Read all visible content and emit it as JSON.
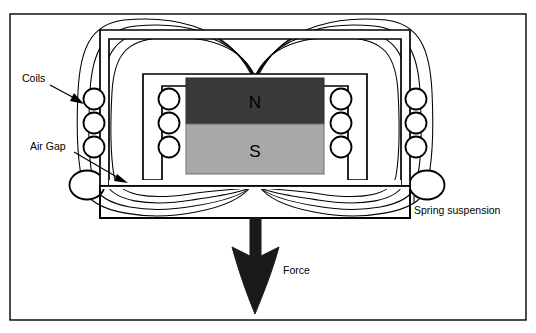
{
  "figure": {
    "background_color": "#ffffff",
    "line_color": "#000000",
    "border": {
      "x": 10,
      "y": 14,
      "width": 516,
      "height": 306,
      "stroke_width": 1.4
    }
  },
  "labels": {
    "coils": "Coils",
    "air_gap": "Air Gap",
    "spring_suspension": "Spring suspension",
    "force": "Force",
    "north_pole": "N",
    "south_pole": "S"
  },
  "colors": {
    "north_pole_fill": "#3a3a3a",
    "south_pole_fill": "#a8a8a8",
    "outline": "#000000",
    "page": "#ffffff",
    "arrow_fill": "#1a1a1a"
  },
  "geometry": {
    "yoke_outer": {
      "x": 100,
      "y": 30,
      "width": 310,
      "height": 188
    },
    "inner_core": {
      "x": 143,
      "y": 74,
      "width": 224,
      "height": 106
    },
    "magnet_north": {
      "x": 186,
      "y": 78,
      "width": 138,
      "height": 46
    },
    "magnet_south": {
      "x": 186,
      "y": 124,
      "width": 138,
      "height": 50
    },
    "bottom_bar": {
      "x": 100,
      "y": 186,
      "width": 310,
      "height": 32
    },
    "air_gap_band": {
      "y_top": 180,
      "y_bottom": 186
    }
  },
  "coil_groups": [
    {
      "name": "left-outer-coils",
      "cx": 94,
      "cys": [
        99,
        123,
        147
      ],
      "r": 10.5
    },
    {
      "name": "left-inner-coils",
      "cx": 162,
      "cys": [
        99,
        123,
        147
      ],
      "r": 10.5
    },
    {
      "name": "right-inner-coils",
      "cx": 348,
      "cys": [
        99,
        123,
        147
      ],
      "r": 10.5
    },
    {
      "name": "right-outer-coils",
      "cx": 420,
      "cys": [
        99,
        123,
        147
      ],
      "r": 10.5
    }
  ],
  "springs": [
    {
      "name": "left-spring",
      "cx": 87,
      "cy": 185,
      "rx": 17,
      "ry": 14
    },
    {
      "name": "right-spring",
      "cx": 427,
      "cy": 185,
      "rx": 17,
      "ry": 14
    }
  ],
  "annotations": {
    "coils_label_pos": {
      "x": 22,
      "y": 82
    },
    "coils_arrow": {
      "x1": 50,
      "y1": 86,
      "x2": 84,
      "y2": 104
    },
    "air_gap_label_pos": {
      "x": 30,
      "y": 150
    },
    "air_gap_arrow": {
      "x1": 72,
      "y1": 153,
      "x2": 128,
      "y2": 183
    },
    "spring_label_pos": {
      "x": 410,
      "y": 212
    },
    "force_label_pos": {
      "x": 283,
      "y": 272
    }
  },
  "force_arrow": {
    "shaft_x": 255,
    "shaft_top": 218,
    "shaft_width": 11,
    "head_tip_y": 315,
    "head_half_width": 24,
    "head_top_y": 250
  },
  "field_lines": {
    "count_per_side": 4,
    "description": "Magnetic flux lines looping from top-center of the magnet outward through the yoke and returning to bottom-center",
    "converge_top": {
      "x": 255,
      "y": 74
    },
    "converge_bottom": {
      "x": 255,
      "y": 186
    }
  }
}
